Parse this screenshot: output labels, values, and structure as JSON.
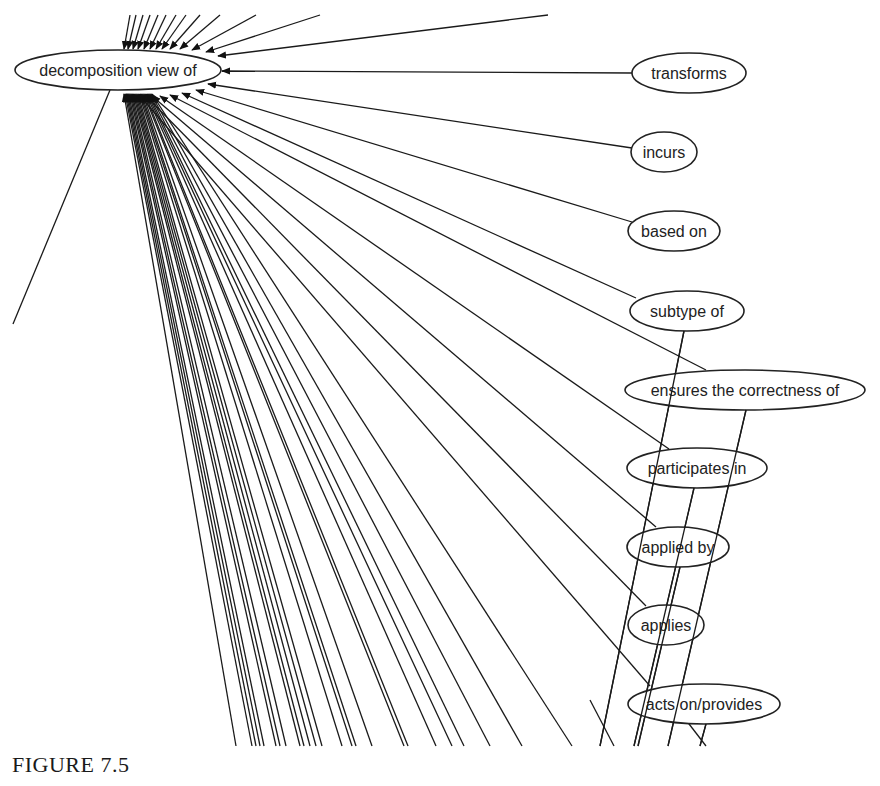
{
  "figure": {
    "caption": "FIGURE 7.5",
    "type": "directed-graph",
    "central_node": {
      "id": "decomposition",
      "label": "decomposition view of",
      "cx": 118,
      "cy": 70,
      "rx": 103,
      "ry": 20
    },
    "nodes": [
      {
        "id": "transforms",
        "label": "transforms",
        "cx": 689,
        "cy": 73,
        "rx": 57,
        "ry": 20
      },
      {
        "id": "incurs",
        "label": "incurs",
        "cx": 664,
        "cy": 152,
        "rx": 33,
        "ry": 20
      },
      {
        "id": "based_on",
        "label": "based on",
        "cx": 674,
        "cy": 231,
        "rx": 46,
        "ry": 20
      },
      {
        "id": "subtype_of",
        "label": "subtype of",
        "cx": 687,
        "cy": 311,
        "rx": 57,
        "ry": 20
      },
      {
        "id": "ensures",
        "label": "ensures the correctness of",
        "cx": 745,
        "cy": 390,
        "rx": 120,
        "ry": 20
      },
      {
        "id": "participates_in",
        "label": "participates in",
        "cx": 697,
        "cy": 468,
        "rx": 70,
        "ry": 20
      },
      {
        "id": "applied_by",
        "label": "applied by",
        "cx": 678,
        "cy": 547,
        "rx": 51,
        "ry": 20
      },
      {
        "id": "applies",
        "label": "applies",
        "cx": 666,
        "cy": 625,
        "rx": 38,
        "ry": 20
      },
      {
        "id": "acts_on_provides",
        "label": "acts on/provides",
        "cx": 704,
        "cy": 704,
        "rx": 76,
        "ry": 20
      }
    ],
    "edges_from_nodes_to_center": [
      {
        "from": "transforms",
        "x1": 632,
        "y1": 73,
        "x2": 222,
        "y2": 71
      },
      {
        "from": "incurs",
        "x1": 632,
        "y1": 148,
        "x2": 208,
        "y2": 84
      },
      {
        "from": "based_on",
        "x1": 632,
        "y1": 222,
        "x2": 196,
        "y2": 90
      },
      {
        "from": "subtype_of",
        "x1": 636,
        "y1": 298,
        "x2": 182,
        "y2": 93
      },
      {
        "from": "ensures",
        "x1": 706,
        "y1": 370,
        "x2": 170,
        "y2": 95
      },
      {
        "from": "participates_in",
        "x1": 669,
        "y1": 449,
        "x2": 160,
        "y2": 96
      },
      {
        "from": "applied_by",
        "x1": 656,
        "y1": 527,
        "x2": 152,
        "y2": 96
      },
      {
        "from": "applies",
        "x1": 646,
        "y1": 606,
        "x2": 146,
        "y2": 96
      },
      {
        "from": "acts_on_provides",
        "x1": 650,
        "y1": 686,
        "x2": 140,
        "y2": 96
      }
    ],
    "edges_from_top": [
      {
        "x1": 548,
        "y1": 15,
        "x2": 218,
        "y2": 56
      },
      {
        "x1": 320,
        "y1": 15,
        "x2": 206,
        "y2": 52
      },
      {
        "x1": 256,
        "y1": 15,
        "x2": 192,
        "y2": 50
      },
      {
        "x1": 220,
        "y1": 15,
        "x2": 180,
        "y2": 49
      },
      {
        "x1": 200,
        "y1": 15,
        "x2": 170,
        "y2": 49
      },
      {
        "x1": 186,
        "y1": 15,
        "x2": 162,
        "y2": 49
      },
      {
        "x1": 176,
        "y1": 15,
        "x2": 156,
        "y2": 49
      },
      {
        "x1": 166,
        "y1": 15,
        "x2": 150,
        "y2": 49
      },
      {
        "x1": 158,
        "y1": 15,
        "x2": 144,
        "y2": 49
      },
      {
        "x1": 150,
        "y1": 15,
        "x2": 138,
        "y2": 49
      },
      {
        "x1": 143,
        "y1": 15,
        "x2": 133,
        "y2": 49
      },
      {
        "x1": 136,
        "y1": 15,
        "x2": 128,
        "y2": 49
      },
      {
        "x1": 130,
        "y1": 15,
        "x2": 124,
        "y2": 49
      }
    ],
    "edges_from_bottom_to_center": [
      {
        "x1": 236,
        "y1": 746
      },
      {
        "x1": 252,
        "y1": 746
      },
      {
        "x1": 256,
        "y1": 746
      },
      {
        "x1": 260,
        "y1": 746
      },
      {
        "x1": 264,
        "y1": 746
      },
      {
        "x1": 276,
        "y1": 746
      },
      {
        "x1": 280,
        "y1": 746
      },
      {
        "x1": 286,
        "y1": 746
      },
      {
        "x1": 300,
        "y1": 746
      },
      {
        "x1": 304,
        "y1": 746
      },
      {
        "x1": 310,
        "y1": 746
      },
      {
        "x1": 316,
        "y1": 746
      },
      {
        "x1": 322,
        "y1": 746
      },
      {
        "x1": 342,
        "y1": 746
      },
      {
        "x1": 352,
        "y1": 746
      },
      {
        "x1": 356,
        "y1": 746
      },
      {
        "x1": 372,
        "y1": 746
      },
      {
        "x1": 404,
        "y1": 746
      },
      {
        "x1": 408,
        "y1": 746
      },
      {
        "x1": 436,
        "y1": 746
      },
      {
        "x1": 452,
        "y1": 746
      },
      {
        "x1": 464,
        "y1": 746
      },
      {
        "x1": 490,
        "y1": 746
      },
      {
        "x1": 522,
        "y1": 746
      },
      {
        "x1": 572,
        "y1": 746
      }
    ],
    "edges_crossing_up_right": [
      {
        "x1": 600,
        "y1": 746,
        "x2": 684,
        "y2": 331
      },
      {
        "x1": 634,
        "y1": 746,
        "x2": 694,
        "y2": 488
      },
      {
        "x1": 638,
        "y1": 746,
        "x2": 680,
        "y2": 567
      },
      {
        "x1": 668,
        "y1": 746,
        "x2": 746,
        "y2": 410
      },
      {
        "x1": 700,
        "y1": 746,
        "x2": 706,
        "y2": 724
      }
    ],
    "edges_down_right_tail": [
      {
        "x1": 614,
        "y1": 746,
        "x2": 590,
        "y2": 700
      },
      {
        "x1": 706,
        "y1": 746,
        "x2": 686,
        "y2": 720
      }
    ],
    "outgoing_left_edge": {
      "x1": 110,
      "y1": 90,
      "x2": 13,
      "y2": 324
    }
  }
}
